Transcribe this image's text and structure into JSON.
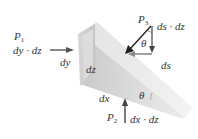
{
  "diagram": {
    "type": "fluid-element-wedge",
    "colors": {
      "wedge_light": "#e6e6e6",
      "wedge_mid": "#cfcfcf",
      "wedge_dark": "#b9b9b9",
      "arrow": "#444444",
      "text": "#333333"
    },
    "labels": {
      "p1_symbol": "P",
      "p1_sub": "1",
      "p1_area": "dy · dz",
      "p2_symbol": "P",
      "p2_sub": "2",
      "p2_area": "dx · dz",
      "p3_symbol": "P",
      "p3_sub": "3",
      "p3_area": "ds · dz",
      "dy": "dy",
      "dz": "dz",
      "dx": "dx",
      "ds": "ds",
      "theta_top": "θ",
      "theta_bottom": "θ"
    }
  }
}
